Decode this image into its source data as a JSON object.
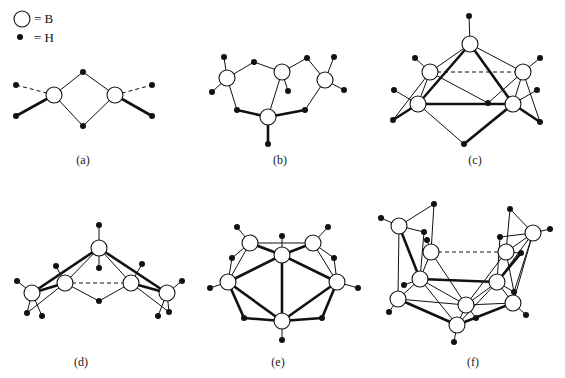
{
  "legend": {
    "items": [
      {
        "symbol": "open-circle",
        "label": "= B"
      },
      {
        "symbol": "filled-dot",
        "label": "= H"
      }
    ]
  },
  "panels": [
    {
      "id": "a",
      "label": "(a)",
      "boron_atoms": 2,
      "hydrogen_atoms": 6
    },
    {
      "id": "b",
      "label": "(b)",
      "boron_atoms": 4,
      "hydrogen_atoms": 10
    },
    {
      "id": "c",
      "label": "(c)",
      "boron_atoms": 5,
      "hydrogen_atoms": 9
    },
    {
      "id": "d",
      "label": "(d)",
      "boron_atoms": 5,
      "hydrogen_atoms": 11
    },
    {
      "id": "e",
      "label": "(e)",
      "boron_atoms": 6,
      "hydrogen_atoms": 10
    },
    {
      "id": "f",
      "label": "(f)",
      "boron_atoms": 10,
      "hydrogen_atoms": 14
    }
  ],
  "colors": {
    "stroke": "#111111",
    "background": "#ffffff",
    "boron_fill": "#ffffff",
    "hydrogen_fill": "#111111"
  }
}
